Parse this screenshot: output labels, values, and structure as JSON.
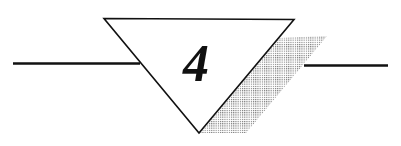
{
  "marker": {
    "label": "4",
    "shape": "inverted-triangle",
    "colors": {
      "stroke": "#111111",
      "fill": "#ffffff",
      "shadow_dots": "#777777"
    }
  }
}
